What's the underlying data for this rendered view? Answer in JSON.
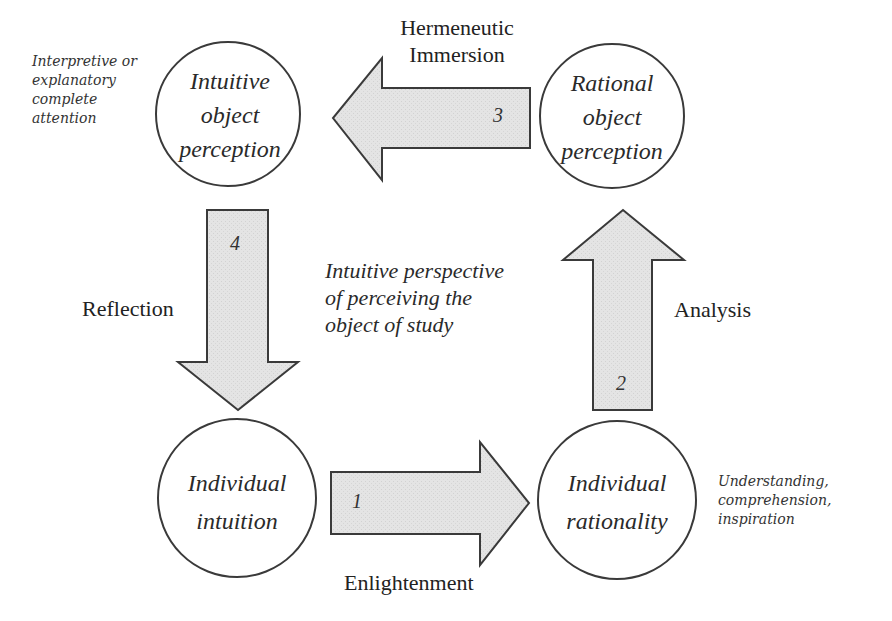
{
  "diagram": {
    "nodes": {
      "intuitive_object_perception": {
        "line1": "Intuitive",
        "line2": "object",
        "line3": "perception"
      },
      "rational_object_perception": {
        "line1": "Rational",
        "line2": "object",
        "line3": "perception"
      },
      "individual_intuition": {
        "line1": "Individual",
        "line2": "intuition"
      },
      "individual_rationality": {
        "line1": "Individual",
        "line2": "rationality"
      }
    },
    "arrows": [
      {
        "number": "1",
        "label": "Enlightenment",
        "direction": "right",
        "from": "Individual intuition",
        "to": "Individual rationality"
      },
      {
        "number": "2",
        "label": "Analysis",
        "direction": "up",
        "from": "Individual rationality",
        "to": "Rational object perception"
      },
      {
        "number": "3",
        "label_line1": "Hermeneutic",
        "label_line2": "Immersion",
        "direction": "left",
        "from": "Rational object perception",
        "to": "Intuitive object perception"
      },
      {
        "number": "4",
        "label": "Reflection",
        "direction": "down",
        "from": "Intuitive object perception",
        "to": "Individual intuition"
      }
    ],
    "notes": {
      "top_left": {
        "line1": "Interpretive or",
        "line2": "explanatory",
        "line3": "complete",
        "line4": "attention"
      },
      "bottom_right": {
        "line1": "Understanding,",
        "line2": "comprehension,",
        "line3": "inspiration"
      },
      "center": {
        "line1": "Intuitive perspective",
        "line2": "of perceiving the",
        "line3": "object of study"
      }
    },
    "colors": {
      "arrow_fill": "#e3e3e3",
      "stroke": "#3a3a3a",
      "background": "#ffffff"
    }
  }
}
